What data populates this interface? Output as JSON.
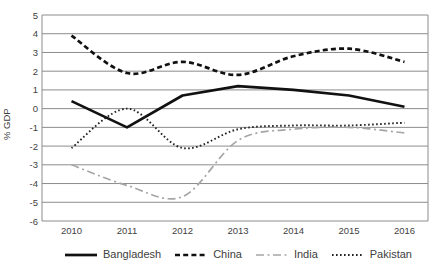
{
  "chart_data": {
    "type": "line",
    "title": "",
    "xlabel": "",
    "ylabel": "% GDP",
    "ylim": [
      -6,
      5
    ],
    "grid": true,
    "legend_position": "bottom",
    "yticks": [
      "5",
      "4",
      "3",
      "2",
      "1",
      "0",
      "-1",
      "-2",
      "-3",
      "-4",
      "-5",
      "-6"
    ],
    "categories": [
      "2010",
      "2011",
      "2012",
      "2013",
      "2014",
      "2015",
      "2016"
    ],
    "series": [
      {
        "name": "Bangladesh",
        "values": [
          0.4,
          -1.0,
          0.7,
          1.2,
          1.0,
          0.7,
          0.1
        ],
        "color": "#111111",
        "style": "solid",
        "width": 2.7,
        "smooth": false
      },
      {
        "name": "China",
        "values": [
          3.9,
          1.9,
          2.5,
          1.8,
          2.8,
          3.2,
          2.5
        ],
        "color": "#111111",
        "style": "dashed",
        "width": 2.7,
        "smooth": true
      },
      {
        "name": "India",
        "values": [
          -3.0,
          -4.1,
          -4.7,
          -1.7,
          -1.1,
          -1.0,
          -1.3
        ],
        "color": "#a6a6a6",
        "style": "dashdot",
        "width": 1.7,
        "smooth": true
      },
      {
        "name": "Pakistan",
        "values": [
          -2.1,
          0.0,
          -2.1,
          -1.1,
          -0.9,
          -0.9,
          -0.75
        ],
        "color": "#222222",
        "style": "dotted",
        "width": 1.9,
        "smooth": true
      }
    ],
    "grid_color": "#8c8c8c"
  }
}
